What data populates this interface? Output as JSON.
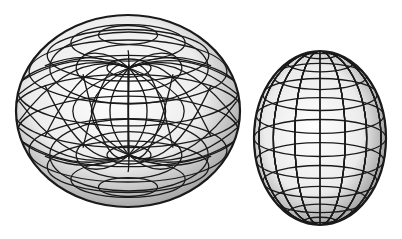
{
  "figure": {
    "width": 402,
    "height": 239,
    "background": "#ffffff",
    "line_color": "#1a1a1a",
    "shade_light": "#ffffff",
    "shade_mid": "#e4e4e4",
    "shade_dark": "#8a8a8a"
  },
  "shapes": [
    {
      "id": "oblate-torus-like-surface",
      "kind": "oblate-with-polar-dimples",
      "cx": 128,
      "cy": 111,
      "rx": 112,
      "ry": 96,
      "pole_top": {
        "x": 129,
        "y": 68,
        "rx": 22,
        "ry": 9
      },
      "pole_bottom": {
        "x": 129,
        "y": 155,
        "rx": 22,
        "ry": 9
      },
      "meridians": 16,
      "parallels": 12
    },
    {
      "id": "prolate-spheroid",
      "kind": "prolate",
      "cx": 320,
      "cy": 138,
      "rx": 66,
      "ry": 87,
      "meridians": 16,
      "parallels": 12
    }
  ]
}
